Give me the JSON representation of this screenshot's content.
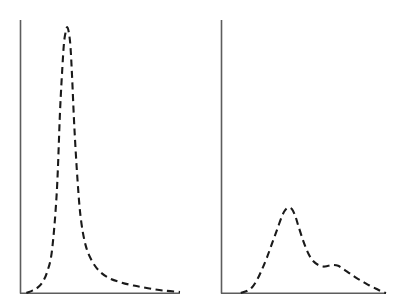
{
  "figure": {
    "title": "",
    "background_color": "#ffffff",
    "panel_count": 2
  },
  "style": {
    "curve_color": "#1a1a1a",
    "axis_color": "#5d5d5d",
    "curve_linestyle": "dashed",
    "curve_dash_pattern": "7 4.5",
    "curve_stroke_width": 2.1,
    "axis_stroke_width": 1.6
  },
  "chart_data": [
    {
      "type": "line",
      "id": "left-panel",
      "title": "",
      "subtitle": "",
      "xlabel": "",
      "ylabel": "",
      "xlim": [
        0,
        100
      ],
      "ylim": [
        0,
        100
      ],
      "grid": false,
      "legend": "none",
      "annotations": [],
      "xticklabels": [],
      "yticklabels": [],
      "description": "Sharp narrow unimodal dashed distribution peaking early with a long right tail",
      "series": [
        {
          "name": "distribution-left",
          "linestyle": "dashed",
          "x": [
            4,
            8,
            11,
            14,
            17,
            20,
            23,
            25,
            26.5,
            27.5,
            28.5,
            29.5,
            30.5,
            31.5,
            32.5,
            34,
            36,
            38,
            41,
            45,
            50,
            56,
            63,
            71,
            80,
            90,
            100
          ],
          "y": [
            0,
            1,
            2,
            4,
            8,
            16,
            38,
            68,
            85,
            94,
            98,
            100,
            98,
            93,
            82,
            62,
            42,
            28,
            18,
            12,
            8,
            5.5,
            4,
            2.8,
            1.8,
            0.9,
            0.4
          ]
        }
      ]
    },
    {
      "type": "line",
      "id": "right-panel",
      "title": "",
      "subtitle": "",
      "xlabel": "",
      "ylabel": "",
      "xlim": [
        0,
        100
      ],
      "ylim": [
        0,
        100
      ],
      "grid": false,
      "legend": "none",
      "annotations": [],
      "xticklabels": [],
      "yticklabels": [],
      "description": "Broader unimodal dashed distribution with a lower peak and a secondary shoulder bump in the right tail",
      "series": [
        {
          "name": "distribution-right",
          "linestyle": "dashed",
          "x": [
            12,
            16,
            19,
            22,
            25,
            28,
            31,
            34,
            37,
            39,
            41,
            43,
            45,
            47,
            50,
            53,
            56,
            59,
            62,
            65,
            68,
            71,
            74,
            78,
            82,
            86,
            90,
            94,
            97,
            100
          ],
          "y": [
            0,
            1.5,
            4,
            9,
            16,
            24,
            33,
            42,
            51,
            55,
            56.5,
            55.5,
            51,
            44,
            34,
            26,
            21,
            18.5,
            17.5,
            18,
            18.5,
            18,
            16,
            13,
            10,
            7.5,
            5,
            2.8,
            1.2,
            0
          ]
        }
      ]
    }
  ]
}
